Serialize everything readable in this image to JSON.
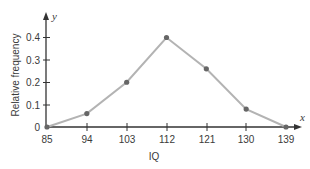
{
  "chart_data": {
    "type": "line",
    "title": "",
    "xlabel": "IQ",
    "ylabel": "Relative frequency",
    "x_axis_var": "x",
    "y_axis_var": "y",
    "categories": [
      "85",
      "94",
      "103",
      "112",
      "121",
      "130",
      "139"
    ],
    "x": [
      85,
      94,
      103,
      112,
      121,
      130,
      139
    ],
    "values": [
      0,
      0.06,
      0.2,
      0.4,
      0.26,
      0.08,
      0
    ],
    "y_ticks": [
      "0",
      "0.1",
      "0.2",
      "0.3",
      "0.4"
    ],
    "ylim": [
      0,
      0.45
    ],
    "grid": false,
    "legend": null,
    "colors": {
      "line": "#b3b3b3",
      "marker": "#666666",
      "axis": "#333333"
    }
  }
}
